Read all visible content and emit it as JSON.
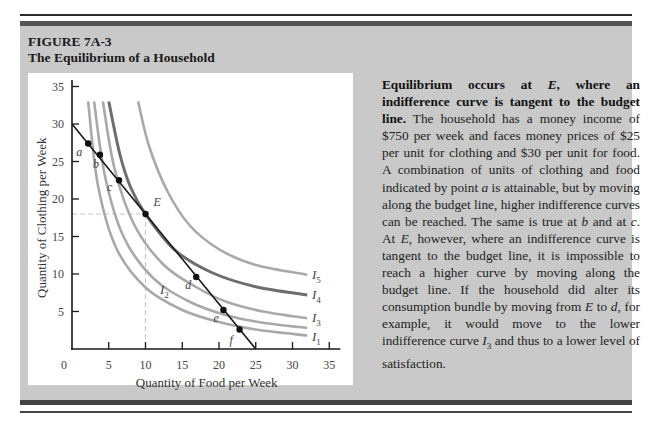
{
  "figure": {
    "number": "FIGURE 7A-3",
    "title": "The Equilibrium of a Household"
  },
  "caption": {
    "bold_lead_1": "Equilibrium occurs at ",
    "bold_lead_E": "E",
    "bold_lead_2": ", where an indifference curve is tangent to the budget line.",
    "body_1": " The household has a money income of $750 per week and faces money prices of $25 per unit for clothing and $30 per unit for food. A combination of units of clothing and food indicated by point ",
    "body_a": "a",
    "body_2": " is attainable, but by moving along the budget line, higher indifference curves can be reached. The same is true at ",
    "body_b": "b",
    "body_3": " and at ",
    "body_c": "c",
    "body_4": ". At ",
    "body_E": "E",
    "body_5": ", however, where an indifference curve is tangent to the budget line, it is impossible to reach a higher curve by moving along the budget line. If the household did alter its consumption bundle by moving from ",
    "body_E2": "E",
    "body_6": " to ",
    "body_d": "d",
    "body_7": ", for example, it would move to the lower indifference curve ",
    "body_I": "I",
    "body_I_sub": "3",
    "body_8": " and thus to a lower level of satisfaction."
  },
  "chart_data": {
    "type": "line",
    "title": "The Equilibrium of a Household",
    "xlabel": "Quantity of Food per Week",
    "ylabel": "Quantity of Clothing per Week",
    "xlim": [
      0,
      35
    ],
    "ylim": [
      0,
      35
    ],
    "x_ticks": [
      "0",
      "5",
      "10",
      "15",
      "20",
      "25",
      "30",
      "35"
    ],
    "y_ticks": [
      "5",
      "10",
      "15",
      "20",
      "25",
      "30",
      "35"
    ],
    "grid": false,
    "budget_line": {
      "name": "Budget line",
      "x": [
        0,
        25
      ],
      "y": [
        30,
        0
      ]
    },
    "points": [
      {
        "label": "a",
        "x": 2.2,
        "y": 27.4
      },
      {
        "label": "b",
        "x": 3.8,
        "y": 25.9
      },
      {
        "label": "c",
        "x": 6.4,
        "y": 22.5
      },
      {
        "label": "E",
        "x": 10,
        "y": 18
      },
      {
        "label": "d",
        "x": 16.9,
        "y": 9.6
      },
      {
        "label": "e",
        "x": 20.6,
        "y": 5.2
      },
      {
        "label": "f",
        "x": 22.8,
        "y": 2.6
      }
    ],
    "guides": {
      "x": 10,
      "y": 18,
      "style": "dashed"
    },
    "series": [
      {
        "name": "I1",
        "x": [
          2.2,
          3.5,
          6,
          10,
          15,
          20,
          25,
          32
        ],
        "y": [
          33,
          22,
          13.5,
          8.2,
          5.2,
          3.6,
          2.6,
          1.8
        ]
      },
      {
        "name": "I2",
        "x": [
          3.0,
          4.5,
          7,
          11,
          16,
          21,
          26,
          32
        ],
        "y": [
          33,
          23,
          15,
          9.5,
          6.3,
          4.5,
          3.5,
          2.8
        ]
      },
      {
        "name": "I3",
        "x": [
          4.2,
          5.8,
          8.5,
          12.5,
          17,
          21,
          26,
          32
        ],
        "y": [
          33,
          24,
          16.5,
          11.2,
          8.2,
          6.3,
          5,
          4.1
        ]
      },
      {
        "name": "I4",
        "x": [
          5.0,
          6.5,
          8,
          10,
          14,
          19,
          25,
          32
        ],
        "y": [
          33,
          26,
          21.5,
          18,
          13.2,
          10.2,
          8.3,
          7.2
        ]
      },
      {
        "name": "I5",
        "x": [
          9.0,
          10.5,
          13,
          16,
          20,
          25,
          32
        ],
        "y": [
          33,
          27,
          21,
          16.5,
          13.3,
          11.2,
          9.9
        ]
      }
    ],
    "curve_labels": [
      {
        "text": "I",
        "sub": "5"
      },
      {
        "text": "I",
        "sub": "4"
      },
      {
        "text": "I",
        "sub": "3"
      },
      {
        "text": "I",
        "sub": "2"
      },
      {
        "text": "I",
        "sub": "1"
      }
    ],
    "colors": {
      "budget_line": "#1a1a1a",
      "indifference": "#a9a9a9",
      "equilibrium_curve": "#6e6e6e",
      "guide": "#c8c8c8"
    }
  }
}
